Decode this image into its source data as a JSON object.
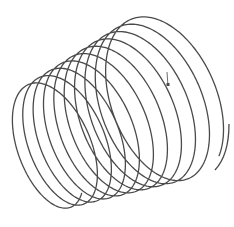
{
  "figure": {
    "stroke_color": "#4a4a4a",
    "background": "#ffffff",
    "stroke_width": 1.3
  },
  "spring": {
    "coils": 10,
    "start": {
      "cx": 46,
      "cy": 148,
      "rx": 32,
      "ry": 64
    },
    "end": {
      "cx": 168,
      "cy": 96,
      "rx": 50,
      "ry": 86
    },
    "rotation_deg": -22,
    "start_angle_deg": 60,
    "tail": {
      "x1": 215,
      "y1": 170,
      "x2": 229,
      "y2": 124
    }
  },
  "marker": {
    "icon": "arrow-marker-icon",
    "x": 168,
    "y": 86
  }
}
